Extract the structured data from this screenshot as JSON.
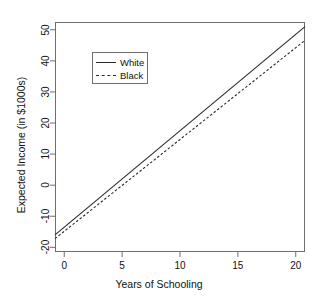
{
  "chart_data": {
    "type": "line",
    "title": "",
    "xlabel": "Years of Schooling",
    "ylabel": "Expected Income (in $1000s)",
    "xlim": [
      -0.8,
      20.8
    ],
    "ylim": [
      -21.5,
      52.5
    ],
    "xticks": [
      0,
      5,
      10,
      15,
      20
    ],
    "xticklabels": [
      "0",
      "5",
      "10",
      "15",
      "20"
    ],
    "yticks": [
      -20,
      -10,
      0,
      10,
      20,
      30,
      40,
      50
    ],
    "yticklabels": [
      "-20",
      "-10",
      "0",
      "10",
      "20",
      "30",
      "40",
      "50"
    ],
    "grid": false,
    "legend_position": "upper left",
    "series": [
      {
        "name": "White",
        "linestyle": "solid",
        "color": "#2b2b2b",
        "x": [
          -0.8,
          20.8
        ],
        "y": [
          -16.0,
          51.0
        ],
        "slope": 3.1,
        "intercept": -13.5,
        "points": [
          {
            "x": 0,
            "y": -13.5
          },
          {
            "x": 5,
            "y": 2.0
          },
          {
            "x": 10,
            "y": 17.5
          },
          {
            "x": 15,
            "y": 33.0
          },
          {
            "x": 20,
            "y": 48.5
          }
        ]
      },
      {
        "name": "Black",
        "linestyle": "dashed",
        "color": "#2b2b2b",
        "x": [
          -0.8,
          20.8
        ],
        "y": [
          -17.2,
          46.6
        ],
        "slope": 2.954,
        "intercept": -14.84,
        "points": [
          {
            "x": 0,
            "y": -14.8
          },
          {
            "x": 5,
            "y": -0.1
          },
          {
            "x": 10,
            "y": 14.7
          },
          {
            "x": 15,
            "y": 29.5
          },
          {
            "x": 20,
            "y": 44.2
          }
        ]
      }
    ]
  },
  "legend": {
    "entries": [
      {
        "label": "White",
        "key": "solid-line-key"
      },
      {
        "label": "Black",
        "key": "dashed-line-key"
      }
    ]
  },
  "axes": {
    "x_title": "Years of Schooling",
    "y_title": "Expected Income (in $1000s)"
  }
}
